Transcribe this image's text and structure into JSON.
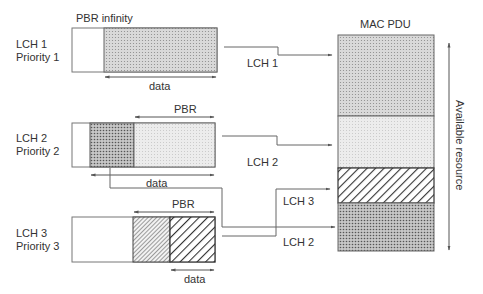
{
  "title": "",
  "channels": [
    {
      "name": "LCH 1",
      "priority": "Priority 1",
      "pbr_label": "PBR infinity",
      "data_label": "data"
    },
    {
      "name": "LCH 2",
      "priority": "Priority 2",
      "pbr_label": "PBR",
      "data_label": "data"
    },
    {
      "name": "LCH 3",
      "priority": "Priority 3",
      "pbr_label": "PBR",
      "data_label": "data"
    }
  ],
  "connectors": [
    {
      "label": "LCH 1"
    },
    {
      "label": "LCH 2"
    },
    {
      "label": "LCH 3"
    },
    {
      "label": "LCH 2"
    }
  ],
  "mac_pdu": {
    "title": "MAC PDU",
    "segments": [
      "LCH 1",
      "LCH 2 (PBR)",
      "LCH 3 (PBR)",
      "LCH 2 (remaining)"
    ]
  },
  "axis": {
    "label": "Available resource"
  },
  "colors": {
    "line": "#555555",
    "border": "#666666"
  }
}
